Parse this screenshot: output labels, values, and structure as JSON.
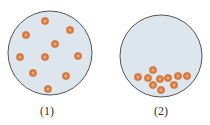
{
  "figures": [
    {
      "label": "(1)",
      "description": "particles evenly dispersed",
      "container": {
        "cx": 50,
        "cy": 53,
        "r": 42
      },
      "particles": [
        [
          45,
          21
        ],
        [
          70,
          30
        ],
        [
          26,
          35
        ],
        [
          55,
          44
        ],
        [
          20,
          57
        ],
        [
          45,
          57
        ],
        [
          78,
          56
        ],
        [
          33,
          73
        ],
        [
          66,
          76
        ],
        [
          48,
          89
        ]
      ]
    },
    {
      "label": "(2)",
      "description": "particles settled at bottom",
      "container": {
        "cx": 161,
        "cy": 56,
        "r": 41
      },
      "particles": [
        [
          153,
          70
        ],
        [
          138,
          77
        ],
        [
          148,
          78
        ],
        [
          160,
          79
        ],
        [
          168,
          78
        ],
        [
          178,
          76
        ],
        [
          187,
          76
        ],
        [
          153,
          85
        ],
        [
          174,
          85
        ],
        [
          161,
          90
        ]
      ]
    }
  ],
  "colors": {
    "container_fill": "#dce6ec",
    "container_stroke": "#555555",
    "particle_fill": "#e07a3c",
    "particle_core": "#f4a870",
    "particle_stroke": "#b85a24"
  }
}
